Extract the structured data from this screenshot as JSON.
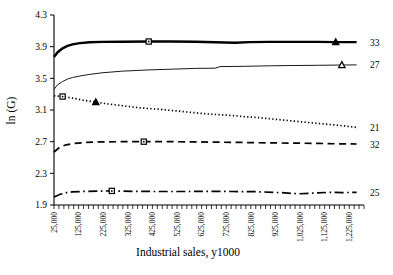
{
  "chart_data": {
    "type": "line",
    "title": "",
    "xlabel": "Industrial sales, y1000",
    "ylabel": "ln (G)",
    "xlim": [
      25000,
      1285000
    ],
    "ylim": [
      1.9,
      4.3
    ],
    "grid": false,
    "legend_position": "right-end-labels",
    "line_color": "#000000",
    "background": "#ffffff",
    "x_minor_step": 20000,
    "y_ticks": [
      {
        "v": 1.9,
        "label": "1.9"
      },
      {
        "v": 2.3,
        "label": "2.3"
      },
      {
        "v": 2.7,
        "label": "2.7"
      },
      {
        "v": 3.1,
        "label": "3.1"
      },
      {
        "v": 3.5,
        "label": "3.5"
      },
      {
        "v": 3.9,
        "label": "3.9"
      },
      {
        "v": 4.3,
        "label": "4.3"
      }
    ],
    "x_ticks": [
      {
        "v": 25000,
        "label": "25,000"
      },
      {
        "v": 125000,
        "label": "125,000"
      },
      {
        "v": 225000,
        "label": "225,000"
      },
      {
        "v": 325000,
        "label": "325,000"
      },
      {
        "v": 425000,
        "label": "425,000"
      },
      {
        "v": 525000,
        "label": "525,000"
      },
      {
        "v": 625000,
        "label": "625,000"
      },
      {
        "v": 725000,
        "label": "725,000"
      },
      {
        "v": 825000,
        "label": "825,000"
      },
      {
        "v": 925000,
        "label": "925,000"
      },
      {
        "v": 1025000,
        "label": "1,025,000"
      },
      {
        "v": 1125000,
        "label": "1,125,000"
      },
      {
        "v": 1225000,
        "label": "1,225,000"
      }
    ],
    "series": [
      {
        "name": "series-33",
        "label": "33",
        "style": "solid-thick",
        "points": [
          [
            25000,
            3.77
          ],
          [
            40000,
            3.83
          ],
          [
            60000,
            3.88
          ],
          [
            80000,
            3.91
          ],
          [
            100000,
            3.93
          ],
          [
            130000,
            3.945
          ],
          [
            170000,
            3.955
          ],
          [
            220000,
            3.96
          ],
          [
            300000,
            3.962
          ],
          [
            410000,
            3.965
          ],
          [
            500000,
            3.965
          ],
          [
            600000,
            3.962
          ],
          [
            680000,
            3.955
          ],
          [
            760000,
            3.95
          ],
          [
            820000,
            3.958
          ],
          [
            900000,
            3.96
          ],
          [
            1000000,
            3.96
          ],
          [
            1100000,
            3.96
          ],
          [
            1170000,
            3.958
          ],
          [
            1255000,
            3.958
          ]
        ],
        "markers": [
          {
            "shape": "square",
            "fill": "open",
            "x": 410000,
            "y": 3.965
          },
          {
            "shape": "triangle",
            "fill": "solid",
            "x": 1170000,
            "y": 3.958
          }
        ],
        "end_label_value": 3.958
      },
      {
        "name": "series-27",
        "label": "27",
        "style": "solid-thin",
        "points": [
          [
            25000,
            3.36
          ],
          [
            40000,
            3.42
          ],
          [
            60000,
            3.46
          ],
          [
            80000,
            3.49
          ],
          [
            100000,
            3.51
          ],
          [
            130000,
            3.53
          ],
          [
            170000,
            3.55
          ],
          [
            220000,
            3.57
          ],
          [
            300000,
            3.59
          ],
          [
            400000,
            3.605
          ],
          [
            500000,
            3.615
          ],
          [
            600000,
            3.625
          ],
          [
            680000,
            3.628
          ],
          [
            700000,
            3.648
          ],
          [
            800000,
            3.652
          ],
          [
            900000,
            3.658
          ],
          [
            1000000,
            3.662
          ],
          [
            1100000,
            3.665
          ],
          [
            1195000,
            3.668
          ],
          [
            1255000,
            3.67
          ]
        ],
        "markers": [
          {
            "shape": "triangle",
            "fill": "open",
            "x": 1195000,
            "y": 3.668
          }
        ],
        "end_label_value": 3.67
      },
      {
        "name": "series-21",
        "label": "21",
        "style": "dotted",
        "points": [
          [
            25000,
            3.28
          ],
          [
            60000,
            3.27
          ],
          [
            100000,
            3.25
          ],
          [
            150000,
            3.22
          ],
          [
            195000,
            3.2
          ],
          [
            250000,
            3.175
          ],
          [
            300000,
            3.155
          ],
          [
            350000,
            3.135
          ],
          [
            400000,
            3.12
          ],
          [
            450000,
            3.11
          ],
          [
            500000,
            3.095
          ],
          [
            550000,
            3.08
          ],
          [
            600000,
            3.065
          ],
          [
            650000,
            3.05
          ],
          [
            700000,
            3.04
          ],
          [
            750000,
            3.03
          ],
          [
            800000,
            3.015
          ],
          [
            850000,
            3.005
          ],
          [
            900000,
            2.99
          ],
          [
            950000,
            2.975
          ],
          [
            1000000,
            2.96
          ],
          [
            1050000,
            2.945
          ],
          [
            1100000,
            2.93
          ],
          [
            1150000,
            2.915
          ],
          [
            1200000,
            2.9
          ],
          [
            1255000,
            2.88
          ]
        ],
        "markers": [
          {
            "shape": "square",
            "fill": "open",
            "x": 60000,
            "y": 3.27
          },
          {
            "shape": "triangle",
            "fill": "solid",
            "x": 195000,
            "y": 3.2
          }
        ],
        "end_label_value": 2.88
      },
      {
        "name": "series-32",
        "label": "32",
        "style": "dashed",
        "points": [
          [
            25000,
            2.57
          ],
          [
            50000,
            2.635
          ],
          [
            75000,
            2.66
          ],
          [
            100000,
            2.675
          ],
          [
            150000,
            2.69
          ],
          [
            200000,
            2.697
          ],
          [
            300000,
            2.7
          ],
          [
            390000,
            2.7
          ],
          [
            500000,
            2.7
          ],
          [
            600000,
            2.697
          ],
          [
            700000,
            2.693
          ],
          [
            800000,
            2.69
          ],
          [
            900000,
            2.685
          ],
          [
            1000000,
            2.682
          ],
          [
            1100000,
            2.678
          ],
          [
            1200000,
            2.672
          ],
          [
            1255000,
            2.67
          ]
        ],
        "markers": [
          {
            "shape": "square",
            "fill": "open",
            "x": 390000,
            "y": 2.7
          }
        ],
        "end_label_value": 2.67
      },
      {
        "name": "series-25",
        "label": "25",
        "style": "dashdot",
        "points": [
          [
            25000,
            2.0
          ],
          [
            50000,
            2.035
          ],
          [
            75000,
            2.055
          ],
          [
            100000,
            2.065
          ],
          [
            150000,
            2.072
          ],
          [
            200000,
            2.075
          ],
          [
            260000,
            2.078
          ],
          [
            350000,
            2.072
          ],
          [
            450000,
            2.07
          ],
          [
            550000,
            2.07
          ],
          [
            650000,
            2.072
          ],
          [
            750000,
            2.07
          ],
          [
            850000,
            2.068
          ],
          [
            950000,
            2.055
          ],
          [
            1020000,
            2.042
          ],
          [
            1080000,
            2.05
          ],
          [
            1150000,
            2.06
          ],
          [
            1200000,
            2.057
          ],
          [
            1255000,
            2.06
          ]
        ],
        "markers": [
          {
            "shape": "square",
            "fill": "open",
            "x": 260000,
            "y": 2.078
          }
        ],
        "end_label_value": 2.06
      }
    ]
  }
}
